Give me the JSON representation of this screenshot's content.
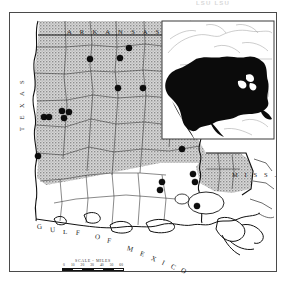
{
  "page": {
    "running_head": "LSU  LSU",
    "figure_type": "species distribution map"
  },
  "frame": {
    "border_color": "#4a4a4a"
  },
  "map": {
    "title_region": "Louisiana",
    "shading": {
      "label": "stippled-range-shading",
      "color": "#b8b8b8",
      "description": "stippled gray indicating upland / known range portion of Louisiana"
    },
    "land_color": "#ffffff",
    "water_color": "#ffffff",
    "line_color": "#111111",
    "labels": {
      "arkansas": "A R K A N S A S",
      "texas": "T E X A S",
      "mississippi": "M I S S .",
      "gulf": "G U L F   O F   M E X I C O"
    },
    "gulf_arc_chars": [
      {
        "ch": "G",
        "x": 36,
        "y": 222,
        "rot": -8
      },
      {
        "ch": "U",
        "x": 49,
        "y": 225,
        "rot": -4
      },
      {
        "ch": "L",
        "x": 62,
        "y": 227,
        "rot": 0
      },
      {
        "ch": "F",
        "x": 75,
        "y": 228,
        "rot": 4
      },
      {
        "ch": "O",
        "x": 94,
        "y": 232,
        "rot": 8
      },
      {
        "ch": "F",
        "x": 106,
        "y": 236,
        "rot": 12
      },
      {
        "ch": "M",
        "x": 126,
        "y": 244,
        "rot": 16
      },
      {
        "ch": "E",
        "x": 139,
        "y": 249,
        "rot": 20
      },
      {
        "ch": "X",
        "x": 150,
        "y": 254,
        "rot": 24
      },
      {
        "ch": "I",
        "x": 161,
        "y": 258,
        "rot": 26
      },
      {
        "ch": "C",
        "x": 170,
        "y": 262,
        "rot": 28
      },
      {
        "ch": "O",
        "x": 180,
        "y": 266,
        "rot": 30
      }
    ]
  },
  "scale": {
    "title": "SCALE - MILES",
    "ticks": [
      "0",
      "10",
      "20",
      "30",
      "40",
      "50",
      "60"
    ],
    "unit": "MILES"
  },
  "inset": {
    "name": "north-america-range-inset",
    "region": "North America",
    "range_fill": "#0a0a0a",
    "border_color": "#333333",
    "background": "#ffffff",
    "description": "Inset map of North America with species range shown in solid black across the contiguous United States and southern Canada"
  },
  "chart_data": {
    "type": "scatter",
    "xlabel": "",
    "ylabel": "",
    "series": [
      {
        "name": "collection-locality",
        "marker": "filled-circle",
        "color": "#0d0d0d",
        "radius_px": 3.1,
        "points": [
          {
            "id": 1,
            "x": 128,
            "y": 47,
            "region": "north-central parish"
          },
          {
            "id": 2,
            "x": 89,
            "y": 58,
            "region": "northwest parish"
          },
          {
            "id": 3,
            "x": 119,
            "y": 57,
            "region": "north-central parish"
          },
          {
            "id": 4,
            "x": 117,
            "y": 87,
            "region": "central-north parish"
          },
          {
            "id": 5,
            "x": 142,
            "y": 87,
            "region": "northeast parish"
          },
          {
            "id": 6,
            "x": 43,
            "y": 116,
            "region": "west-central parish"
          },
          {
            "id": 7,
            "x": 48,
            "y": 116,
            "region": "west-central parish"
          },
          {
            "id": 8,
            "x": 61,
            "y": 110,
            "region": "west-central parish"
          },
          {
            "id": 9,
            "x": 63,
            "y": 117,
            "region": "west-central parish"
          },
          {
            "id": 10,
            "x": 68,
            "y": 111,
            "region": "west-central parish"
          },
          {
            "id": 11,
            "x": 37,
            "y": 155,
            "region": "southwest parish"
          },
          {
            "id": 12,
            "x": 181,
            "y": 148,
            "region": "Florida parishes north"
          },
          {
            "id": 13,
            "x": 192,
            "y": 173,
            "region": "Florida parishes east"
          },
          {
            "id": 14,
            "x": 194,
            "y": 181,
            "region": "Florida parishes east"
          },
          {
            "id": 15,
            "x": 161,
            "y": 181,
            "region": "Baton Rouge area"
          },
          {
            "id": 16,
            "x": 159,
            "y": 189,
            "region": "Baton Rouge area"
          },
          {
            "id": 17,
            "x": 196,
            "y": 205,
            "region": "southeast / delta"
          }
        ]
      }
    ],
    "legend": [],
    "grid": false
  }
}
